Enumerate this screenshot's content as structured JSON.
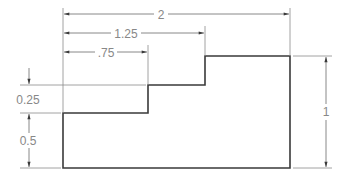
{
  "drawing": {
    "type": "dimensioned-step-profile",
    "colors": {
      "object_line": "#3a3a3a",
      "dimension_line": "#6a6a6a",
      "text": "#888888",
      "background": "#ffffff"
    },
    "horizontal_dimensions": [
      {
        "label": "2",
        "value": 2
      },
      {
        "label": "1.25",
        "value": 1.25
      },
      {
        "label": ".75",
        "value": 0.75
      }
    ],
    "vertical_dimensions": [
      {
        "label": "0.25",
        "value": 0.25,
        "side": "left"
      },
      {
        "label": "0.5",
        "value": 0.5,
        "side": "left"
      },
      {
        "label": "1",
        "value": 1,
        "side": "right"
      }
    ]
  }
}
